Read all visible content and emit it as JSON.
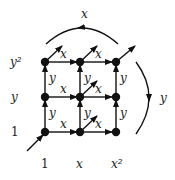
{
  "diagram": {
    "row_labels": [
      "y²",
      "y",
      "1"
    ],
    "col_labels": [
      "1",
      "x",
      "x²"
    ],
    "horizontal_edge_label": "x",
    "vertical_edge_label": "y",
    "top_arc_label": "x",
    "right_arc_label": "y",
    "nodes": [
      {
        "row": 0,
        "col": 0
      },
      {
        "row": 0,
        "col": 1
      },
      {
        "row": 0,
        "col": 2
      },
      {
        "row": 1,
        "col": 0
      },
      {
        "row": 1,
        "col": 1
      },
      {
        "row": 1,
        "col": 2
      },
      {
        "row": 2,
        "col": 0
      },
      {
        "row": 2,
        "col": 1
      },
      {
        "row": 2,
        "col": 2
      }
    ],
    "diagonal_arrows_from": [
      {
        "row": 0,
        "col": 0
      },
      {
        "row": 0,
        "col": 1
      },
      {
        "row": 0,
        "col": 2
      },
      {
        "row": 1,
        "col": 1
      },
      {
        "row": 2,
        "col": 1
      }
    ],
    "incoming_arrow_to": {
      "row": 2,
      "col": 0
    },
    "colors": {
      "ink": "#111111",
      "background": "#ffffff"
    }
  }
}
